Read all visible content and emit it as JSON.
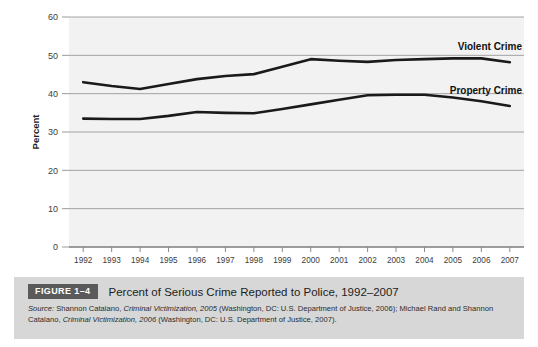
{
  "chart_data": {
    "type": "line",
    "xlabel": "",
    "ylabel": "Percent",
    "ylim": [
      0,
      60
    ],
    "yticks": [
      0,
      10,
      20,
      30,
      40,
      50,
      60
    ],
    "grid": true,
    "legend_position": "inline-right",
    "categories": [
      "1992",
      "1993",
      "1994",
      "1995",
      "1996",
      "1997",
      "1998",
      "1999",
      "2000",
      "2001",
      "2002",
      "2003",
      "2004",
      "2005",
      "2006",
      "2007"
    ],
    "series": [
      {
        "name": "Violent Crime",
        "values": [
          43.0,
          42.0,
          41.2,
          42.5,
          43.8,
          44.6,
          45.1,
          47.0,
          49.0,
          48.6,
          48.3,
          48.8,
          49.0,
          49.2,
          49.2,
          48.2
        ]
      },
      {
        "name": "Property Crime",
        "values": [
          33.5,
          33.4,
          33.4,
          34.2,
          35.2,
          35.0,
          34.9,
          36.0,
          37.2,
          38.4,
          39.6,
          39.7,
          39.7,
          39.0,
          38.0,
          36.8
        ]
      }
    ]
  },
  "axes": {
    "y_label": "Percent",
    "y_tick_labels": [
      "60",
      "50",
      "40",
      "30",
      "20",
      "10",
      "0"
    ],
    "x_tick_labels": [
      "1992",
      "1993",
      "1994",
      "1995",
      "1996",
      "1997",
      "1998",
      "1999",
      "2000",
      "2001",
      "2002",
      "2003",
      "2004",
      "2005",
      "2006",
      "2007"
    ]
  },
  "series_labels": {
    "violent": "Violent Crime",
    "property": "Property Crime"
  },
  "caption": {
    "badge": "FIGURE 1–4",
    "title": "Percent of Serious Crime Reported to Police, 1992–2007",
    "source_lead": "Source:",
    "source_body_1": " Shannon Catalano, ",
    "source_italic_1": "Criminal Victimization, 2005",
    "source_body_2": " (Washington, DC: U.S. Department of Justice, 2006); Michael Rand and Shannon Catalano, ",
    "source_italic_2": "Criminal Victimization, 2006",
    "source_body_3": " (Washington, DC: U.S. Department of Justice, 2007)."
  },
  "colors": {
    "plot_background": "#f2f2f2",
    "gridline": "#9a9a9a",
    "line": "#1a1a1a",
    "caption_panel": "#d7d7d7",
    "badge": "#5a5a5a",
    "page_background": "#ffffff"
  }
}
